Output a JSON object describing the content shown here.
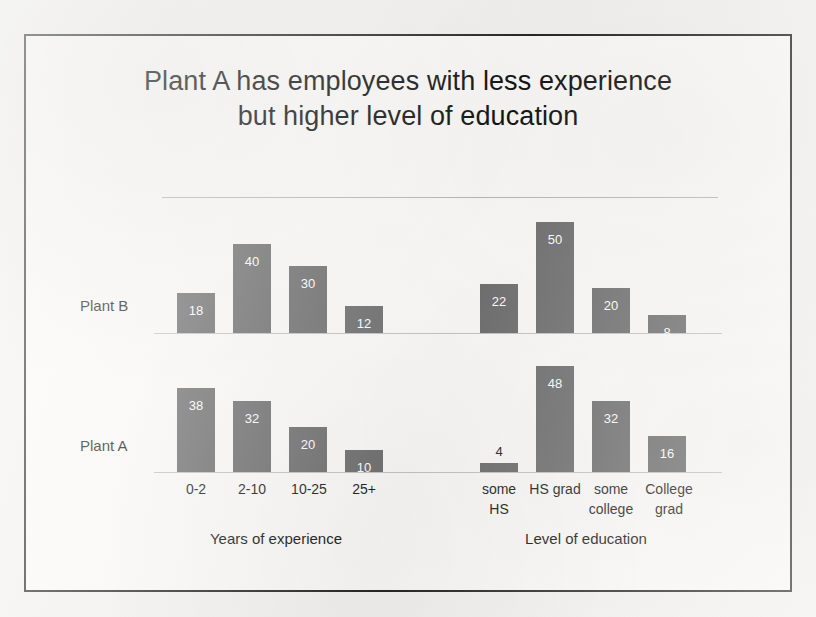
{
  "slide": {
    "title": "Plant A has employees with less experience\nbut higher level of education"
  },
  "chart_data": {
    "type": "bar",
    "title": "Plant A has employees with less experience but higher level of education",
    "orientation": "vertical",
    "grid": false,
    "legend": null,
    "row_labels": [
      "Plant B",
      "Plant A"
    ],
    "panels": [
      {
        "name": "experience",
        "axis_label": "Years of experience",
        "categories": [
          "0-2",
          "2-10",
          "10-25",
          "25+"
        ],
        "series": [
          {
            "name": "Plant B",
            "values": [
              18,
              40,
              30,
              12
            ]
          },
          {
            "name": "Plant A",
            "values": [
              38,
              32,
              20,
              10
            ]
          }
        ]
      },
      {
        "name": "education",
        "axis_label": "Level of education",
        "categories": [
          "some\nHS",
          "HS grad",
          "some\ncollege",
          "College\ngrad"
        ],
        "series": [
          {
            "name": "Plant B",
            "values": [
              22,
              50,
              20,
              8
            ]
          },
          {
            "name": "Plant A",
            "values": [
              4,
              48,
              32,
              16
            ]
          }
        ]
      }
    ],
    "value_max": 50,
    "ylabel": "",
    "bar_color": "#6f6f6f",
    "value_label_color": "#ffffff"
  },
  "bars": {
    "plant_b": [
      {
        "name": "plant-b-exp-0-2",
        "value": "18",
        "x": 151,
        "w": 38,
        "h": 40,
        "outside": false
      },
      {
        "name": "plant-b-exp-2-10",
        "value": "40",
        "x": 207,
        "w": 38,
        "h": 89,
        "outside": false
      },
      {
        "name": "plant-b-exp-10-25",
        "value": "30",
        "x": 263,
        "w": 38,
        "h": 67,
        "outside": false
      },
      {
        "name": "plant-b-exp-25plus",
        "value": "12",
        "x": 319,
        "w": 38,
        "h": 27,
        "outside": false
      },
      {
        "name": "plant-b-edu-some-hs",
        "value": "22",
        "x": 454,
        "w": 38,
        "h": 49,
        "outside": false
      },
      {
        "name": "plant-b-edu-hs-grad",
        "value": "50",
        "x": 510,
        "w": 38,
        "h": 111,
        "outside": false
      },
      {
        "name": "plant-b-edu-some-college",
        "value": "20",
        "x": 566,
        "w": 38,
        "h": 45,
        "outside": false
      },
      {
        "name": "plant-b-edu-college-grad",
        "value": "8",
        "x": 622,
        "w": 38,
        "h": 18,
        "outside": false
      }
    ],
    "plant_a": [
      {
        "name": "plant-a-exp-0-2",
        "value": "38",
        "x": 151,
        "w": 38,
        "h": 84,
        "outside": false
      },
      {
        "name": "plant-a-exp-2-10",
        "value": "32",
        "x": 207,
        "w": 38,
        "h": 71,
        "outside": false
      },
      {
        "name": "plant-a-exp-10-25",
        "value": "20",
        "x": 263,
        "w": 38,
        "h": 45,
        "outside": false
      },
      {
        "name": "plant-a-exp-25plus",
        "value": "10",
        "x": 319,
        "w": 38,
        "h": 22,
        "outside": false
      },
      {
        "name": "plant-a-edu-some-hs",
        "value": "4",
        "x": 454,
        "w": 38,
        "h": 9,
        "outside": true
      },
      {
        "name": "plant-a-edu-hs-grad",
        "value": "48",
        "x": 510,
        "w": 38,
        "h": 106,
        "outside": false
      },
      {
        "name": "plant-a-edu-some-college",
        "value": "32",
        "x": 566,
        "w": 38,
        "h": 71,
        "outside": false
      },
      {
        "name": "plant-a-edu-college-grad",
        "value": "16",
        "x": 622,
        "w": 38,
        "h": 36,
        "outside": false
      }
    ]
  },
  "category_labels": [
    {
      "name": "cat-label-0-2",
      "text": "0-2",
      "x": 145,
      "w": 50
    },
    {
      "name": "cat-label-2-10",
      "text": "2-10",
      "x": 201,
      "w": 50
    },
    {
      "name": "cat-label-10-25",
      "text": "10-25",
      "x": 255,
      "w": 56
    },
    {
      "name": "cat-label-25plus",
      "text": "25+",
      "x": 313,
      "w": 50
    },
    {
      "name": "cat-label-some-hs",
      "text": "some\nHS",
      "x": 446,
      "w": 54
    },
    {
      "name": "cat-label-hs-grad",
      "text": "HS grad",
      "x": 500,
      "w": 58
    },
    {
      "name": "cat-label-some-college",
      "text": "some\ncollege",
      "x": 556,
      "w": 58
    },
    {
      "name": "cat-label-college-grad",
      "text": "College\ngrad",
      "x": 612,
      "w": 62
    }
  ],
  "group_labels": {
    "experience": "Years of experience",
    "education": "Level of education"
  },
  "row_labels": {
    "plant_b": "Plant B",
    "plant_a": "Plant A"
  }
}
